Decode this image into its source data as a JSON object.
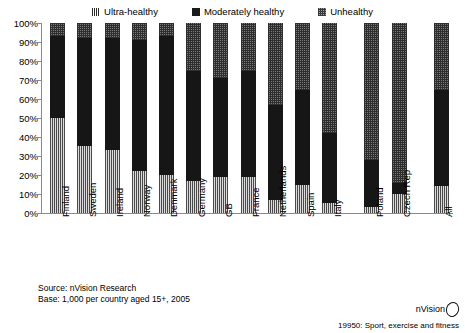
{
  "legend": {
    "items": [
      {
        "label": "Ultra-healthy",
        "key": "ultra",
        "icon": "legend-swatch-ultra-healthy",
        "color": "#6b6b6b"
      },
      {
        "label": "Moderately healthy",
        "key": "moderate",
        "icon": "legend-swatch-moderately-healthy",
        "color": "#1a1a1a"
      },
      {
        "label": "Unhealthy",
        "key": "unhealthy",
        "icon": "legend-swatch-unhealthy",
        "color": "#9a9a9a"
      }
    ]
  },
  "source": {
    "line1": "Source: nVision Research",
    "line2": "Base: 1,000 per country aged 15+, 2005"
  },
  "brand": {
    "name": "nVision",
    "footnote": "19950: Sport, exercise and fitness"
  },
  "chart_data": {
    "type": "bar",
    "stacked": true,
    "title": "",
    "xlabel": "",
    "ylabel": "",
    "ylim": [
      0,
      100
    ],
    "yticks": [
      "0%",
      "10%",
      "20%",
      "30%",
      "40%",
      "50%",
      "60%",
      "70%",
      "80%",
      "90%",
      "100%"
    ],
    "ytick_values": [
      0,
      10,
      20,
      30,
      40,
      50,
      60,
      70,
      80,
      90,
      100
    ],
    "grid": false,
    "legend_position": "top",
    "categories": [
      "Finland",
      "Sweden",
      "Ireland",
      "Norway",
      "Denmark",
      "Germany",
      "GB",
      "France",
      "Netherlands",
      "Spain",
      "Italy",
      "Poland",
      "Czech Rep",
      "All"
    ],
    "gap_after": [
      "Italy",
      "Czech Rep"
    ],
    "series": [
      {
        "name": "Unhealthy",
        "key": "unhealthy",
        "color": "#9a9a9a",
        "values": [
          50,
          35,
          33,
          22,
          20,
          17,
          19,
          19,
          7,
          15,
          5,
          3,
          10,
          14
        ]
      },
      {
        "name": "Moderately healthy",
        "key": "moderate",
        "color": "#1a1a1a",
        "values": [
          43,
          57,
          59,
          69,
          73,
          58,
          52,
          56,
          50,
          50,
          37,
          25,
          6,
          51
        ]
      },
      {
        "name": "Ultra-healthy",
        "key": "ultra",
        "color": "#6b6b6b",
        "values": [
          7,
          8,
          8,
          9,
          7,
          25,
          29,
          25,
          43,
          35,
          58,
          72,
          84,
          35
        ]
      }
    ]
  }
}
